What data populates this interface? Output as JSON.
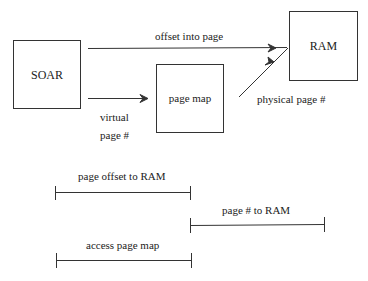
{
  "diagram": {
    "boxes": {
      "soar": "SOAR",
      "page_map": "page map",
      "ram": "RAM"
    },
    "edge_labels": {
      "offset_into_page": "offset into page",
      "virtual_line1": "virtual",
      "virtual_line2": "page #",
      "physical_page": "physical page #"
    },
    "timing": [
      {
        "label": "page offset to RAM"
      },
      {
        "label": "page # to RAM"
      },
      {
        "label": "access page map"
      }
    ]
  }
}
